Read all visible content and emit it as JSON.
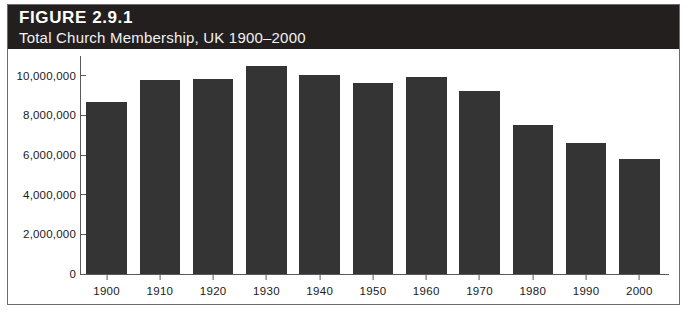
{
  "figure": {
    "label": "FIGURE 2.9.1",
    "caption": "Total Church Membership, UK 1900–2000",
    "frame_color": "#6b6b6b",
    "caption_bar_color": "#231f1f"
  },
  "chart_data": {
    "type": "bar",
    "title": "Total Church Membership, UK 1900–2000",
    "xlabel": "",
    "ylabel": "",
    "categories": [
      "1900",
      "1910",
      "1920",
      "1930",
      "1940",
      "1950",
      "1960",
      "1970",
      "1980",
      "1990",
      "2000"
    ],
    "values": [
      8700000,
      9800000,
      9850000,
      10500000,
      10050000,
      9650000,
      9950000,
      9250000,
      7500000,
      6600000,
      5800000
    ],
    "ylim": [
      0,
      11000000
    ],
    "yticks": [
      0,
      2000000,
      4000000,
      6000000,
      8000000,
      10000000
    ],
    "ytick_labels": [
      "0",
      "2,000,000",
      "4,000,000",
      "6,000,000",
      "8,000,000",
      "10,000,000"
    ],
    "bar_color": "#343434",
    "grid": false,
    "legend": false
  }
}
